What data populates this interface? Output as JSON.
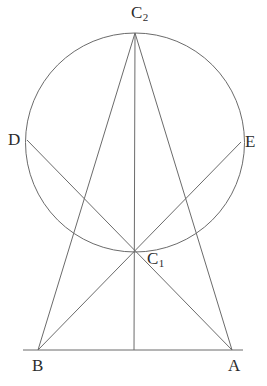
{
  "figure": {
    "kind": "geometric-construction",
    "width": 267,
    "height": 386,
    "background_color": "#ffffff",
    "stroke_color": "#6b6b6b",
    "label_color": "#2b2b2b",
    "stroke_width": 1
  },
  "labels": {
    "C2": {
      "text": "C",
      "sub": "2"
    },
    "C1": {
      "text": "C",
      "sub": "1"
    },
    "D": {
      "text": "D",
      "sub": ""
    },
    "E": {
      "text": "E",
      "sub": ""
    },
    "B": {
      "text": "B",
      "sub": ""
    },
    "A": {
      "text": "A",
      "sub": ""
    }
  },
  "points": {
    "C2": {
      "x": 135,
      "y": 33
    },
    "C1": {
      "x": 134,
      "y": 252
    },
    "D": {
      "x": 27,
      "y": 140
    },
    "E": {
      "x": 241,
      "y": 142
    },
    "B": {
      "x": 38,
      "y": 350
    },
    "A": {
      "x": 232,
      "y": 350
    },
    "baseLeft": {
      "x": 23,
      "y": 350
    },
    "baseRight": {
      "x": 243,
      "y": 350
    },
    "footV": {
      "x": 134,
      "y": 350
    }
  },
  "circle": {
    "cx": 135,
    "cy": 142.5,
    "r": 109.5
  },
  "segments": [
    {
      "name": "base-line-BA",
      "from": "baseLeft",
      "to": "baseRight"
    },
    {
      "name": "chord-C2-to-A",
      "from": "C2",
      "to": "A"
    },
    {
      "name": "chord-C2-to-B",
      "from": "C2",
      "to": "B"
    },
    {
      "name": "axis-C2-to-foot",
      "from": "C2",
      "to": "footV"
    },
    {
      "name": "chord-D-to-A",
      "from": "D",
      "to": "A"
    },
    {
      "name": "chord-E-to-B",
      "from": "E",
      "to": "B"
    }
  ]
}
